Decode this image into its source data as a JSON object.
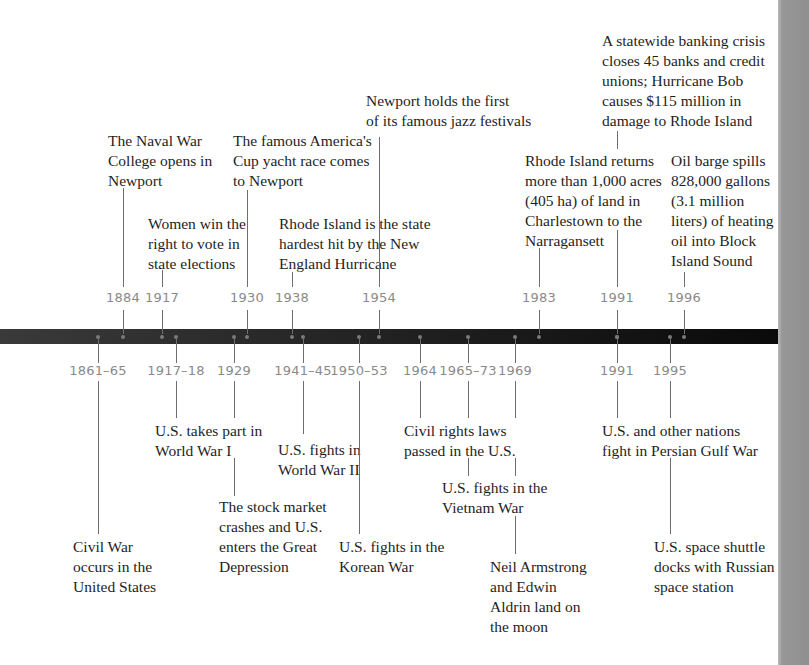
{
  "timeline": {
    "colors": {
      "bar": "#1a1a1a",
      "year_text": "#8a8a8a",
      "label_text": "#1e1e1e",
      "side_strip": "#939393"
    },
    "top_events": [
      {
        "year": "1884",
        "label": "The Naval War\nCollege opens in\nNewport"
      },
      {
        "year": "1917",
        "label": "Women win the\nright to vote in\nstate elections"
      },
      {
        "year": "1930",
        "label": "The famous America's\nCup yacht race comes\nto Newport"
      },
      {
        "year": "1938",
        "label": "Rhode Island is the state\nhardest hit by the New\nEngland Hurricane"
      },
      {
        "year": "1954",
        "label": "Newport holds the first\nof its famous jazz festivals"
      },
      {
        "year": "1983",
        "label": "Rhode Island returns\nmore than 1,000 acres\n(405 ha) of land in\nCharlestown to the\nNarragansett"
      },
      {
        "year": "1991",
        "label": "A statewide banking crisis\ncloses 45 banks and credit\nunions; Hurricane Bob\ncauses $115 million in\ndamage to Rhode Island"
      },
      {
        "year": "1996",
        "label": "Oil barge spills\n828,000 gallons\n(3.1 million\nliters) of heating\noil into Block\nIsland Sound"
      }
    ],
    "bottom_events": [
      {
        "year": "1861–65",
        "label": "Civil War\noccurs in the\nUnited States"
      },
      {
        "year": "1917–18",
        "label": "U.S. takes part in\nWorld War I"
      },
      {
        "year": "1929",
        "label": "The stock market\ncrashes and U.S.\nenters the Great\nDepression"
      },
      {
        "year": "1941–45",
        "label": "U.S. fights in\nWorld War II"
      },
      {
        "year": "1950–53",
        "label": "U.S. fights in the\nKorean War"
      },
      {
        "year": "1964",
        "label": "Civil rights laws\npassed in the U.S."
      },
      {
        "year": "1965–73",
        "label": "U.S. fights in the\nVietnam War"
      },
      {
        "year": "1969",
        "label": "Neil Armstrong\nand Edwin\nAldrin land on\nthe moon"
      },
      {
        "year": "1991",
        "label": "U.S. and other nations\nfight in Persian Gulf War"
      },
      {
        "year": "1995",
        "label": "U.S. space shuttle\ndocks with Russian\nspace station"
      }
    ]
  }
}
